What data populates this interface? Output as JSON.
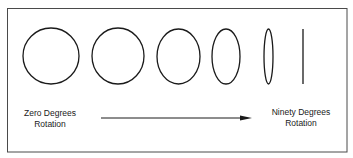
{
  "figure": {
    "stroke_color": "#1a1a1a",
    "border_color": "#4a4a4a",
    "background": "#ffffff",
    "shapes": [
      {
        "id": "shape-1",
        "type": "ellipse",
        "cx": 51,
        "cy": 56,
        "rx": 28,
        "ry": 28
      },
      {
        "id": "shape-2",
        "type": "ellipse",
        "cx": 118,
        "cy": 56,
        "rx": 26,
        "ry": 28
      },
      {
        "id": "shape-3",
        "type": "ellipse",
        "cx": 178.5,
        "cy": 56.5,
        "rx": 21.5,
        "ry": 27.5
      },
      {
        "id": "shape-4",
        "type": "ellipse",
        "cx": 226,
        "cy": 56.5,
        "rx": 14,
        "ry": 27.5
      },
      {
        "id": "shape-5",
        "type": "ellipse",
        "cx": 268.5,
        "cy": 56.5,
        "rx": 4.5,
        "ry": 27.5
      },
      {
        "id": "shape-6",
        "type": "line",
        "x": 303,
        "y1": 29,
        "y2": 84
      }
    ],
    "arrow": {
      "x1": 101,
      "x2": 252,
      "y": 118
    },
    "labels": {
      "start": {
        "line1": "Zero Degrees",
        "line2": "Rotation"
      },
      "end": {
        "line1": "Ninety Degrees",
        "line2": "Rotation"
      }
    }
  }
}
